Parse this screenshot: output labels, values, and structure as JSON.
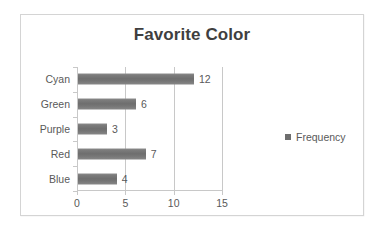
{
  "chart_data": {
    "type": "bar",
    "orientation": "horizontal",
    "title": "Favorite Color",
    "xlabel": "",
    "ylabel": "",
    "categories": [
      "Blue",
      "Red",
      "Purple",
      "Green",
      "Cyan"
    ],
    "values": [
      4,
      7,
      3,
      6,
      12
    ],
    "data_labels": [
      "4",
      "7",
      "3",
      "6",
      "12"
    ],
    "series": [
      {
        "name": "Frequency",
        "values": [
          4,
          7,
          3,
          6,
          12
        ]
      }
    ],
    "xlim": [
      0,
      15
    ],
    "xticks": [
      0,
      5,
      10,
      15
    ],
    "xtick_labels": [
      "0",
      "5",
      "10",
      "15"
    ],
    "grid": "vertical",
    "legend": {
      "position": "right",
      "entries": [
        "Frequency"
      ]
    },
    "colors": {
      "bar": "#6e6e6e",
      "text": "#595959",
      "title": "#3f3f3f",
      "axis": "#c8c8c8",
      "frame": "#d4d4d4",
      "background": "#ffffff"
    }
  },
  "legend": {
    "swatch_name": "legend-color-swatch",
    "label": "Frequency"
  }
}
